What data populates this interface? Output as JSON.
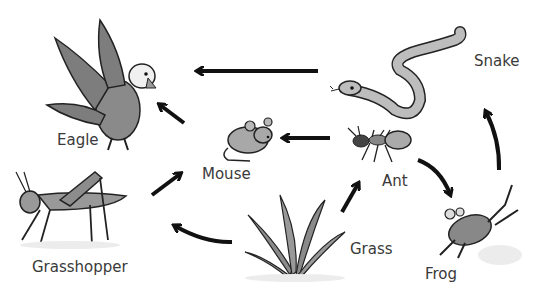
{
  "diagram": {
    "type": "food-web",
    "organisms": [
      {
        "id": "eagle",
        "label": "Eagle"
      },
      {
        "id": "snake",
        "label": "Snake"
      },
      {
        "id": "mouse",
        "label": "Mouse"
      },
      {
        "id": "ant",
        "label": "Ant"
      },
      {
        "id": "grasshopper",
        "label": "Grasshopper"
      },
      {
        "id": "grass",
        "label": "Grass"
      },
      {
        "id": "frog",
        "label": "Frog"
      }
    ],
    "arrows": [
      {
        "from": "snake",
        "to": "eagle"
      },
      {
        "from": "mouse",
        "to": "eagle"
      },
      {
        "from": "ant",
        "to": "mouse"
      },
      {
        "from": "grasshopper",
        "to": "mouse"
      },
      {
        "from": "grass",
        "to": "grasshopper"
      },
      {
        "from": "grass",
        "to": "ant"
      },
      {
        "from": "ant",
        "to": "frog"
      },
      {
        "from": "frog",
        "to": "snake"
      }
    ]
  }
}
